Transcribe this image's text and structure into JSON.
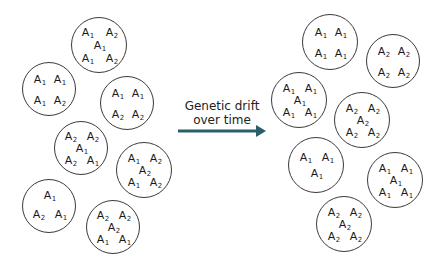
{
  "diagram": {
    "caption": {
      "line1": "Genetic drift",
      "line2": "over time"
    },
    "arrow": {
      "color": "#2b5e6c",
      "x1": 178,
      "x2": 266,
      "y": 131
    },
    "before": {
      "populations": [
        {
          "cx": 99,
          "cy": 45,
          "r": 28,
          "alleles": [
            {
              "g": "A",
              "s": "1",
              "x": -12,
              "y": -13
            },
            {
              "g": "A",
              "s": "2",
              "x": 12,
              "y": -13
            },
            {
              "g": "A",
              "s": "1",
              "x": 0,
              "y": 0
            },
            {
              "g": "A",
              "s": "1",
              "x": -12,
              "y": 13
            },
            {
              "g": "A",
              "s": "2",
              "x": 12,
              "y": 13
            }
          ]
        },
        {
          "cx": 49,
          "cy": 89,
          "r": 27,
          "alleles": [
            {
              "g": "A",
              "s": "1",
              "x": -10,
              "y": -10
            },
            {
              "g": "A",
              "s": "1",
              "x": 10,
              "y": -10
            },
            {
              "g": "A",
              "s": "1",
              "x": -10,
              "y": 11
            },
            {
              "g": "A",
              "s": "2",
              "x": 10,
              "y": 11
            }
          ]
        },
        {
          "cx": 127,
          "cy": 103,
          "r": 27,
          "alleles": [
            {
              "g": "A",
              "s": "1",
              "x": -10,
              "y": -10
            },
            {
              "g": "A",
              "s": "1",
              "x": 10,
              "y": -10
            },
            {
              "g": "A",
              "s": "2",
              "x": -10,
              "y": 11
            },
            {
              "g": "A",
              "s": "2",
              "x": 10,
              "y": 11
            }
          ]
        },
        {
          "cx": 81,
          "cy": 148,
          "r": 27,
          "alleles": [
            {
              "g": "A",
              "s": "2",
              "x": -11,
              "y": -12
            },
            {
              "g": "A",
              "s": "2",
              "x": 11,
              "y": -12
            },
            {
              "g": "A",
              "s": "1",
              "x": 0,
              "y": 0
            },
            {
              "g": "A",
              "s": "2",
              "x": -11,
              "y": 12
            },
            {
              "g": "A",
              "s": "1",
              "x": 11,
              "y": 12
            }
          ]
        },
        {
          "cx": 144,
          "cy": 170,
          "r": 28,
          "alleles": [
            {
              "g": "A",
              "s": "1",
              "x": -11,
              "y": -12
            },
            {
              "g": "A",
              "s": "2",
              "x": 11,
              "y": -12
            },
            {
              "g": "A",
              "s": "2",
              "x": 0,
              "y": 0
            },
            {
              "g": "A",
              "s": "1",
              "x": -11,
              "y": 12
            },
            {
              "g": "A",
              "s": "2",
              "x": 11,
              "y": 12
            }
          ]
        },
        {
          "cx": 49,
          "cy": 206,
          "r": 27,
          "alleles": [
            {
              "g": "A",
              "s": "1",
              "x": 0,
              "y": -11
            },
            {
              "g": "A",
              "s": "2",
              "x": -11,
              "y": 8
            },
            {
              "g": "A",
              "s": "1",
              "x": 11,
              "y": 8
            }
          ]
        },
        {
          "cx": 113,
          "cy": 227,
          "r": 27,
          "alleles": [
            {
              "g": "A",
              "s": "2",
              "x": -11,
              "y": -12
            },
            {
              "g": "A",
              "s": "2",
              "x": 11,
              "y": -12
            },
            {
              "g": "A",
              "s": "2",
              "x": 0,
              "y": 0
            },
            {
              "g": "A",
              "s": "1",
              "x": -11,
              "y": 12
            },
            {
              "g": "A",
              "s": "1",
              "x": 11,
              "y": 12
            }
          ]
        }
      ]
    },
    "after": {
      "populations": [
        {
          "cx": 330,
          "cy": 42,
          "r": 28,
          "alleles": [
            {
              "g": "A",
              "s": "1",
              "x": -10,
              "y": -10
            },
            {
              "g": "A",
              "s": "1",
              "x": 10,
              "y": -10
            },
            {
              "g": "A",
              "s": "1",
              "x": -10,
              "y": 11
            },
            {
              "g": "A",
              "s": "1",
              "x": 10,
              "y": 11
            }
          ]
        },
        {
          "cx": 393,
          "cy": 61,
          "r": 27,
          "alleles": [
            {
              "g": "A",
              "s": "2",
              "x": -10,
              "y": -10
            },
            {
              "g": "A",
              "s": "2",
              "x": 10,
              "y": -10
            },
            {
              "g": "A",
              "s": "2",
              "x": -10,
              "y": 11
            },
            {
              "g": "A",
              "s": "2",
              "x": 10,
              "y": 11
            }
          ]
        },
        {
          "cx": 299,
          "cy": 100,
          "r": 28,
          "alleles": [
            {
              "g": "A",
              "s": "1",
              "x": -11,
              "y": -12
            },
            {
              "g": "A",
              "s": "1",
              "x": 11,
              "y": -12
            },
            {
              "g": "A",
              "s": "1",
              "x": 0,
              "y": 0
            },
            {
              "g": "A",
              "s": "1",
              "x": -11,
              "y": 12
            },
            {
              "g": "A",
              "s": "1",
              "x": 11,
              "y": 12
            }
          ]
        },
        {
          "cx": 362,
          "cy": 120,
          "r": 28,
          "alleles": [
            {
              "g": "A",
              "s": "2",
              "x": -11,
              "y": -12
            },
            {
              "g": "A",
              "s": "2",
              "x": 11,
              "y": -12
            },
            {
              "g": "A",
              "s": "2",
              "x": 0,
              "y": 0
            },
            {
              "g": "A",
              "s": "2",
              "x": -11,
              "y": 12
            },
            {
              "g": "A",
              "s": "2",
              "x": 11,
              "y": 12
            }
          ]
        },
        {
          "cx": 316,
          "cy": 165,
          "r": 28,
          "alleles": [
            {
              "g": "A",
              "s": "1",
              "x": -11,
              "y": -8
            },
            {
              "g": "A",
              "s": "1",
              "x": 11,
              "y": -8
            },
            {
              "g": "A",
              "s": "1",
              "x": 0,
              "y": 8
            }
          ]
        },
        {
          "cx": 395,
          "cy": 180,
          "r": 28,
          "alleles": [
            {
              "g": "A",
              "s": "1",
              "x": -11,
              "y": -12
            },
            {
              "g": "A",
              "s": "1",
              "x": 11,
              "y": -12
            },
            {
              "g": "A",
              "s": "1",
              "x": 0,
              "y": 0
            },
            {
              "g": "A",
              "s": "1",
              "x": -11,
              "y": 12
            },
            {
              "g": "A",
              "s": "1",
              "x": 11,
              "y": 12
            }
          ]
        },
        {
          "cx": 344,
          "cy": 224,
          "r": 28,
          "alleles": [
            {
              "g": "A",
              "s": "2",
              "x": -11,
              "y": -12
            },
            {
              "g": "A",
              "s": "2",
              "x": 11,
              "y": -12
            },
            {
              "g": "A",
              "s": "2",
              "x": 0,
              "y": 0
            },
            {
              "g": "A",
              "s": "2",
              "x": -11,
              "y": 12
            },
            {
              "g": "A",
              "s": "2",
              "x": 11,
              "y": 12
            }
          ]
        }
      ]
    }
  }
}
